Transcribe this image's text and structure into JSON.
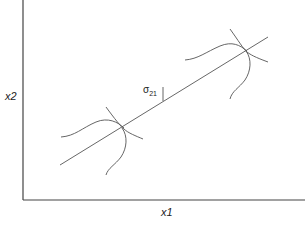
{
  "diagram": {
    "axes": {
      "x_label": "x1",
      "y_label": "x2"
    },
    "annotation": {
      "symbol": "σ",
      "subscript": "21"
    },
    "line_color": "#555555",
    "axis_color": "#444444"
  }
}
